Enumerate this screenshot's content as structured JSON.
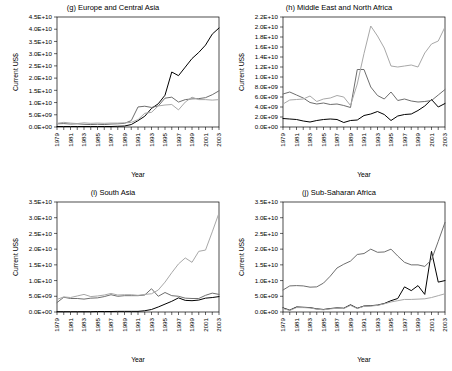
{
  "figure": {
    "axis_titles": {
      "x": "Year",
      "y": "Current US$"
    },
    "series_colors": {
      "black": "#000000",
      "dark_gray": "#6e6e6e",
      "light_gray": "#a8a8a8"
    },
    "series_names": [
      "series-black",
      "series-dark-gray",
      "series-light-gray"
    ],
    "years_all": [
      1979,
      1980,
      1981,
      1982,
      1983,
      1984,
      1985,
      1986,
      1987,
      1988,
      1989,
      1990,
      1991,
      1992,
      1993,
      1994,
      1995,
      1996,
      1997,
      1998,
      1999,
      2000,
      2001,
      2002,
      2003
    ],
    "year_ticks": [
      "1979",
      "1981",
      "1983",
      "1985",
      "1987",
      "1989",
      "1991",
      "1993",
      "1995",
      "1997",
      "1999",
      "2001",
      "2003"
    ]
  },
  "chart_data": [
    {
      "id": "g",
      "type": "line",
      "title": "(g) Europe and Central Asia",
      "xlabel": "Year",
      "ylabel": "Current US$",
      "xlim": [
        1979,
        2003
      ],
      "ylim": [
        0,
        45000000000
      ],
      "ytick_step": 5000000000,
      "ytick_labels": [
        "0.0E+00",
        "5.0E+09",
        "1.0E+10",
        "1.5E+10",
        "2.0E+10",
        "2.5E+10",
        "3.0E+10",
        "3.5E+10",
        "4.0E+10",
        "4.5E+10"
      ],
      "ytick_values": [
        0,
        5000000000,
        10000000000,
        15000000000,
        20000000000,
        25000000000,
        30000000000,
        35000000000,
        40000000000,
        45000000000
      ],
      "grid": false,
      "legend": "none",
      "x": [
        1979,
        1980,
        1981,
        1982,
        1983,
        1984,
        1985,
        1986,
        1987,
        1988,
        1989,
        1990,
        1991,
        1992,
        1993,
        1994,
        1995,
        1996,
        1997,
        1998,
        1999,
        2000,
        2001,
        2002,
        2003
      ],
      "series": [
        {
          "name": "series-black",
          "color": "#000000",
          "values": [
            200000000.0,
            200000000.0,
            200000000.0,
            200000000.0,
            200000000.0,
            200000000.0,
            200000000.0,
            200000000.0,
            200000000.0,
            300000000.0,
            400000000.0,
            1000000000.0,
            2600000000.0,
            4400000000.0,
            7600000000.0,
            9500000000.0,
            13000000000.0,
            22500000000.0,
            21000000000.0,
            24500000000.0,
            28000000000.0,
            30500000000.0,
            33500000000.0,
            38000000000.0,
            40500000000.0
          ]
        },
        {
          "name": "series-dark-gray",
          "color": "#6e6e6e",
          "values": [
            1300000000.0,
            1400000000.0,
            1200000000.0,
            1300000000.0,
            1100000000.0,
            1000000000.0,
            1100000000.0,
            1000000000.0,
            1200000000.0,
            1300000000.0,
            1500000000.0,
            2600000000.0,
            8200000000.0,
            8500000000.0,
            8000000000.0,
            8600000000.0,
            11800000000.0,
            12200000000.0,
            10200000000.0,
            11200000000.0,
            11500000000.0,
            11600000000.0,
            12000000000.0,
            13200000000.0,
            14800000000.0
          ]
        },
        {
          "name": "series-light-gray",
          "color": "#a8a8a8",
          "values": [
            1500000000.0,
            1900000000.0,
            1600000000.0,
            1400000000.0,
            1700000000.0,
            1500000000.0,
            1600000000.0,
            1500000000.0,
            1600000000.0,
            1600000000.0,
            1700000000.0,
            1900000000.0,
            3000000000.0,
            5600000000.0,
            6000000000.0,
            8600000000.0,
            9000000000.0,
            9200000000.0,
            7000000000.0,
            10200000000.0,
            12200000000.0,
            11200000000.0,
            11200000000.0,
            11000000000.0,
            11200000000.0
          ]
        }
      ]
    },
    {
      "id": "h",
      "type": "line",
      "title": "(h) Middle East and North Africa",
      "xlabel": "Year",
      "ylabel": "Current US$",
      "xlim": [
        1979,
        2003
      ],
      "ylim": [
        0,
        22000000000
      ],
      "ytick_step": 2000000000,
      "ytick_labels": [
        "0.0E+00",
        "2.0E+09",
        "4.0E+09",
        "6.0E+09",
        "8.0E+09",
        "1.0E+10",
        "1.2E+10",
        "1.4E+10",
        "1.6E+10",
        "1.8E+10",
        "2.0E+10",
        "2.2E+10"
      ],
      "ytick_values": [
        0,
        2000000000,
        4000000000,
        6000000000,
        8000000000,
        10000000000,
        12000000000,
        14000000000,
        16000000000,
        18000000000,
        20000000000,
        22000000000
      ],
      "grid": false,
      "legend": "none",
      "x": [
        1979,
        1980,
        1981,
        1982,
        1983,
        1984,
        1985,
        1986,
        1987,
        1988,
        1989,
        1990,
        1991,
        1992,
        1993,
        1994,
        1995,
        1996,
        1997,
        1998,
        1999,
        2000,
        2001,
        2002,
        2003
      ],
      "series": [
        {
          "name": "series-black",
          "color": "#000000",
          "values": [
            1700000000.0,
            1600000000.0,
            1500000000.0,
            1200000000.0,
            1000000000.0,
            1300000000.0,
            1500000000.0,
            1600000000.0,
            1500000000.0,
            900000000.0,
            1300000000.0,
            1400000000.0,
            2300000000.0,
            2600000000.0,
            3100000000.0,
            2500000000.0,
            1300000000.0,
            2200000000.0,
            2500000000.0,
            2600000000.0,
            3300000000.0,
            4200000000.0,
            5500000000.0,
            4000000000.0,
            4700000000.0
          ]
        },
        {
          "name": "series-dark-gray",
          "color": "#6e6e6e",
          "values": [
            6600000000.0,
            7000000000.0,
            6400000000.0,
            5800000000.0,
            4900000000.0,
            4600000000.0,
            4800000000.0,
            4500000000.0,
            4600000000.0,
            4300000000.0,
            3900000000.0,
            11500000000.0,
            11500000000.0,
            8000000000.0,
            6300000000.0,
            5600000000.0,
            7000000000.0,
            5300000000.0,
            5600000000.0,
            5200000000.0,
            5000000000.0,
            5100000000.0,
            5300000000.0,
            6400000000.0,
            7500000000.0
          ]
        },
        {
          "name": "series-light-gray",
          "color": "#a8a8a8",
          "values": [
            4600000000.0,
            5400000000.0,
            5500000000.0,
            5600000000.0,
            6200000000.0,
            5100000000.0,
            5600000000.0,
            5800000000.0,
            6300000000.0,
            6000000000.0,
            4300000000.0,
            8600000000.0,
            14700000000.0,
            20200000000.0,
            18200000000.0,
            15800000000.0,
            12200000000.0,
            12000000000.0,
            12200000000.0,
            12400000000.0,
            12000000000.0,
            14800000000.0,
            16600000000.0,
            17200000000.0,
            20000000000.0
          ]
        }
      ]
    },
    {
      "id": "i",
      "type": "line",
      "title": "(i) South Asia",
      "xlabel": "Year",
      "ylabel": "Current US$",
      "xlim": [
        1979,
        2003
      ],
      "ylim": [
        0,
        35000000000
      ],
      "ytick_step": 5000000000,
      "ytick_labels": [
        "0.0E+00",
        "5.0E+09",
        "1.0E+10",
        "1.5E+10",
        "2.0E+10",
        "2.5E+10",
        "3.0E+10",
        "3.5E+10"
      ],
      "ytick_values": [
        0,
        5000000000,
        10000000000,
        15000000000,
        20000000000,
        25000000000,
        30000000000,
        35000000000
      ],
      "grid": false,
      "legend": "none",
      "x": [
        1979,
        1980,
        1981,
        1982,
        1983,
        1984,
        1985,
        1986,
        1987,
        1988,
        1989,
        1990,
        1991,
        1992,
        1993,
        1994,
        1995,
        1996,
        1997,
        1998,
        1999,
        2000,
        2001,
        2002,
        2003
      ],
      "series": [
        {
          "name": "series-black",
          "color": "#000000",
          "values": [
            100000000.0,
            100000000.0,
            100000000.0,
            100000000.0,
            100000000.0,
            100000000.0,
            150000000.0,
            150000000.0,
            150000000.0,
            200000000.0,
            200000000.0,
            200000000.0,
            200000000.0,
            400000000.0,
            800000000.0,
            1600000000.0,
            2500000000.0,
            3400000000.0,
            4500000000.0,
            3700000000.0,
            3600000000.0,
            3800000000.0,
            4400000000.0,
            4600000000.0,
            4900000000.0
          ]
        },
        {
          "name": "series-dark-gray",
          "color": "#6e6e6e",
          "values": [
            3000000000.0,
            4700000000.0,
            4300000000.0,
            4300000000.0,
            4100000000.0,
            4400000000.0,
            4500000000.0,
            4900000000.0,
            5500000000.0,
            5000000000.0,
            5200000000.0,
            5200000000.0,
            5200000000.0,
            5400000000.0,
            7400000000.0,
            5000000000.0,
            6200000000.0,
            5200000000.0,
            5000000000.0,
            4400000000.0,
            4300000000.0,
            4300000000.0,
            5300000000.0,
            6000000000.0,
            5600000000.0
          ]
        },
        {
          "name": "series-light-gray",
          "color": "#a8a8a8",
          "values": [
            4000000000.0,
            4800000000.0,
            4600000000.0,
            5100000000.0,
            5600000000.0,
            4900000000.0,
            5100000000.0,
            5400000000.0,
            5900000000.0,
            5400000000.0,
            5500000000.0,
            5500000000.0,
            5300000000.0,
            5600000000.0,
            5800000000.0,
            7000000000.0,
            9500000000.0,
            12500000000.0,
            15300000000.0,
            17200000000.0,
            15800000000.0,
            19300000000.0,
            19700000000.0,
            25500000000.0,
            31500000000.0
          ]
        }
      ]
    },
    {
      "id": "j",
      "type": "line",
      "title": "(j) Sub-Saharan Africa",
      "xlabel": "Year",
      "ylabel": "Current US$",
      "xlim": [
        1979,
        2003
      ],
      "ylim": [
        0,
        35000000000
      ],
      "ytick_step": 5000000000,
      "ytick_labels": [
        "0.0E+00",
        "5.0E+09",
        "1.0E+10",
        "1.5E+10",
        "2.0E+10",
        "2.5E+10",
        "3.0E+10",
        "3.5E+10"
      ],
      "ytick_values": [
        0,
        5000000000,
        10000000000,
        15000000000,
        20000000000,
        25000000000,
        30000000000,
        35000000000
      ],
      "grid": false,
      "legend": "none",
      "x": [
        1979,
        1980,
        1981,
        1982,
        1983,
        1984,
        1985,
        1986,
        1987,
        1988,
        1989,
        1990,
        1991,
        1992,
        1993,
        1994,
        1995,
        1996,
        1997,
        1998,
        1999,
        2000,
        2001,
        2002,
        2003
      ],
      "series": [
        {
          "name": "series-black",
          "color": "#000000",
          "values": [
            1300000000.0,
            600000000.0,
            1600000000.0,
            1500000000.0,
            1400000000.0,
            1000000000.0,
            800000000.0,
            1100000000.0,
            1300000000.0,
            1200000000.0,
            2300000000.0,
            1200000000.0,
            1900000000.0,
            2000000000.0,
            2200000000.0,
            2700000000.0,
            3600000000.0,
            4300000000.0,
            8000000000.0,
            6800000000.0,
            8400000000.0,
            5600000000.0,
            19300000000.0,
            9500000000.0,
            10000000000.0
          ]
        },
        {
          "name": "series-dark-gray",
          "color": "#6e6e6e",
          "values": [
            7000000000.0,
            8300000000.0,
            8400000000.0,
            8300000000.0,
            7900000000.0,
            8000000000.0,
            9200000000.0,
            11400000000.0,
            14000000000.0,
            15200000000.0,
            16200000000.0,
            18300000000.0,
            18600000000.0,
            20000000000.0,
            19000000000.0,
            19100000000.0,
            20000000000.0,
            17800000000.0,
            15800000000.0,
            15000000000.0,
            15000000000.0,
            14500000000.0,
            16600000000.0,
            22500000000.0,
            28500000000.0
          ]
        },
        {
          "name": "series-light-gray",
          "color": "#a8a8a8",
          "values": [
            1100000000.0,
            500000000.0,
            1400000000.0,
            1400000000.0,
            1300000000.0,
            900000000.0,
            700000000.0,
            1000000000.0,
            1200000000.0,
            1100000000.0,
            2100000000.0,
            1100000000.0,
            1800000000.0,
            1900000000.0,
            2100000000.0,
            2600000000.0,
            3200000000.0,
            3600000000.0,
            4000000000.0,
            4000000000.0,
            4100000000.0,
            4200000000.0,
            4600000000.0,
            5200000000.0,
            5800000000.0
          ]
        }
      ]
    }
  ]
}
